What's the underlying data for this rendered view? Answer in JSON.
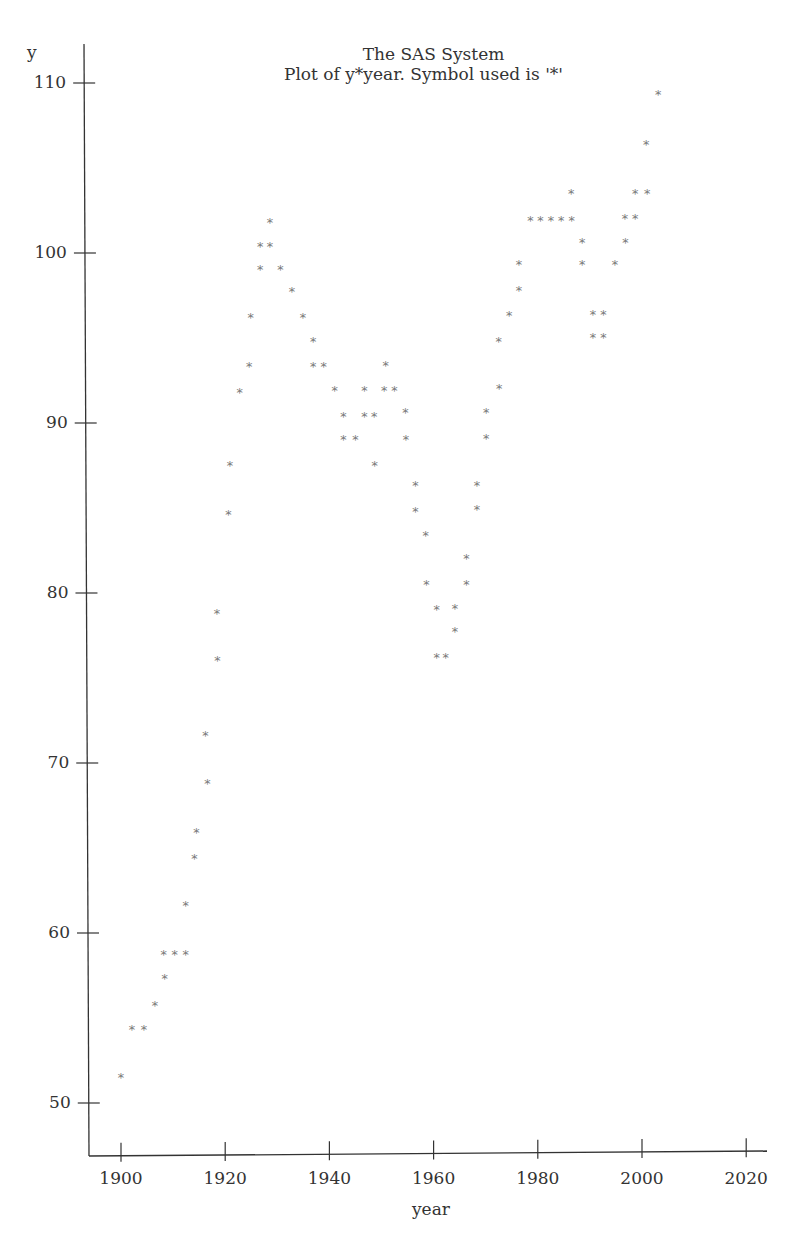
{
  "header": {
    "title_line1": "The SAS System",
    "title_line2": "Plot of y*year.  Symbol used is '*'"
  },
  "chart_data": {
    "type": "scatter",
    "title": "The SAS System",
    "subtitle": "Plot of y*year.  Symbol used is '*'",
    "xlabel": "year",
    "ylabel": "y",
    "marker": "*",
    "marker_color": "#7a7a7a",
    "axis_color": "#333333",
    "grid": false,
    "legend": "none",
    "xlim": [
      1894,
      2024
    ],
    "ylim": [
      47,
      112
    ],
    "x_ticks": [
      1900,
      1920,
      1940,
      1960,
      1980,
      2000,
      2020
    ],
    "x_tick_labels": [
      "1900",
      "1920",
      "1940",
      "1960",
      "1980",
      "2000",
      "2020"
    ],
    "y_ticks": [
      50,
      60,
      70,
      80,
      90,
      100,
      110
    ],
    "y_tick_labels": [
      "50",
      "60",
      "70",
      "80",
      "90",
      "100",
      "110"
    ],
    "points": [
      {
        "x": 1900.0,
        "y": 51.6
      },
      {
        "x": 1902.1,
        "y": 54.4
      },
      {
        "x": 1904.4,
        "y": 54.4
      },
      {
        "x": 1906.5,
        "y": 55.8
      },
      {
        "x": 1908.4,
        "y": 57.4
      },
      {
        "x": 1908.2,
        "y": 58.8
      },
      {
        "x": 1910.3,
        "y": 58.8
      },
      {
        "x": 1912.4,
        "y": 58.8
      },
      {
        "x": 1912.4,
        "y": 61.7
      },
      {
        "x": 1914.1,
        "y": 64.5
      },
      {
        "x": 1914.5,
        "y": 66.0
      },
      {
        "x": 1916.6,
        "y": 68.9
      },
      {
        "x": 1916.2,
        "y": 71.7
      },
      {
        "x": 1918.5,
        "y": 76.1
      },
      {
        "x": 1918.4,
        "y": 78.9
      },
      {
        "x": 1920.6,
        "y": 84.7
      },
      {
        "x": 1920.9,
        "y": 87.6
      },
      {
        "x": 1922.8,
        "y": 91.9
      },
      {
        "x": 1924.6,
        "y": 93.4
      },
      {
        "x": 1924.9,
        "y": 96.3
      },
      {
        "x": 1926.7,
        "y": 99.1
      },
      {
        "x": 1926.7,
        "y": 100.5
      },
      {
        "x": 1928.6,
        "y": 100.5
      },
      {
        "x": 1928.6,
        "y": 101.9
      },
      {
        "x": 1930.6,
        "y": 99.1
      },
      {
        "x": 1932.8,
        "y": 97.8
      },
      {
        "x": 1934.9,
        "y": 96.3
      },
      {
        "x": 1936.9,
        "y": 94.9
      },
      {
        "x": 1936.9,
        "y": 93.4
      },
      {
        "x": 1938.9,
        "y": 93.4
      },
      {
        "x": 1941.0,
        "y": 92.0
      },
      {
        "x": 1942.7,
        "y": 90.5
      },
      {
        "x": 1942.7,
        "y": 89.1
      },
      {
        "x": 1945.0,
        "y": 89.1
      },
      {
        "x": 1946.7,
        "y": 92.0
      },
      {
        "x": 1946.7,
        "y": 90.5
      },
      {
        "x": 1948.6,
        "y": 90.5
      },
      {
        "x": 1948.7,
        "y": 87.6
      },
      {
        "x": 1950.8,
        "y": 93.5
      },
      {
        "x": 1950.5,
        "y": 92.0
      },
      {
        "x": 1952.5,
        "y": 92.0
      },
      {
        "x": 1954.6,
        "y": 90.7
      },
      {
        "x": 1954.7,
        "y": 89.1
      },
      {
        "x": 1956.5,
        "y": 86.4
      },
      {
        "x": 1956.5,
        "y": 84.9
      },
      {
        "x": 1958.5,
        "y": 83.5
      },
      {
        "x": 1958.6,
        "y": 80.6
      },
      {
        "x": 1960.6,
        "y": 79.1
      },
      {
        "x": 1960.6,
        "y": 76.3
      },
      {
        "x": 1962.3,
        "y": 76.3
      },
      {
        "x": 1964.1,
        "y": 79.2
      },
      {
        "x": 1964.1,
        "y": 77.8
      },
      {
        "x": 1966.3,
        "y": 82.1
      },
      {
        "x": 1966.3,
        "y": 80.6
      },
      {
        "x": 1968.3,
        "y": 86.4
      },
      {
        "x": 1968.3,
        "y": 85.0
      },
      {
        "x": 1970.1,
        "y": 90.7
      },
      {
        "x": 1970.1,
        "y": 89.2
      },
      {
        "x": 1972.5,
        "y": 94.9
      },
      {
        "x": 1972.6,
        "y": 92.1
      },
      {
        "x": 1974.5,
        "y": 96.4
      },
      {
        "x": 1976.4,
        "y": 99.4
      },
      {
        "x": 1976.4,
        "y": 97.9
      },
      {
        "x": 1978.6,
        "y": 102.0
      },
      {
        "x": 1980.5,
        "y": 102.0
      },
      {
        "x": 1982.5,
        "y": 102.0
      },
      {
        "x": 1984.5,
        "y": 102.0
      },
      {
        "x": 1986.5,
        "y": 102.0
      },
      {
        "x": 1986.4,
        "y": 103.6
      },
      {
        "x": 1988.5,
        "y": 100.7
      },
      {
        "x": 1988.5,
        "y": 99.4
      },
      {
        "x": 1990.6,
        "y": 96.5
      },
      {
        "x": 1990.6,
        "y": 95.1
      },
      {
        "x": 1992.6,
        "y": 96.5
      },
      {
        "x": 1992.6,
        "y": 95.1
      },
      {
        "x": 1994.8,
        "y": 99.4
      },
      {
        "x": 1996.8,
        "y": 100.7
      },
      {
        "x": 1996.7,
        "y": 102.1
      },
      {
        "x": 1998.7,
        "y": 103.6
      },
      {
        "x": 1998.7,
        "y": 102.1
      },
      {
        "x": 2001.0,
        "y": 103.6
      },
      {
        "x": 2000.8,
        "y": 106.5
      },
      {
        "x": 2003.1,
        "y": 109.4
      }
    ]
  }
}
